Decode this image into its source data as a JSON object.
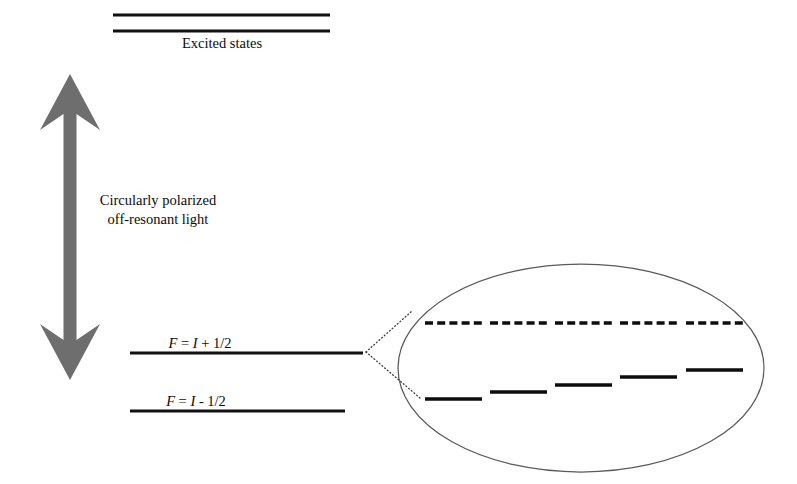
{
  "figure": {
    "type": "energy-level-diagram",
    "background_color": "#ffffff",
    "width": 797,
    "height": 484
  },
  "labels": {
    "excited_states": "Excited states",
    "beam_line1": "Circularly polarized",
    "beam_line2": "off-resonant light",
    "upper_hyperfine_F": "F",
    "upper_hyperfine_eq": " = ",
    "upper_hyperfine_I": "I",
    "upper_hyperfine_rest": " + 1/2",
    "lower_hyperfine_F": "F",
    "lower_hyperfine_eq": " = ",
    "lower_hyperfine_I": "I",
    "lower_hyperfine_rest": " - 1/2"
  },
  "colors": {
    "line_black": "#101010",
    "arrow_gray": "#6e6e6e",
    "ellipse_gray": "#5a5a5a",
    "leader_gray": "#3a3a3a",
    "text_black": "#0c0c0c"
  },
  "levels": {
    "excited": [
      {
        "name": "excited-level-upper",
        "x1": 113,
        "x2": 330,
        "y": 15
      },
      {
        "name": "excited-level-lower",
        "x1": 113,
        "x2": 330,
        "y": 31
      }
    ],
    "ground": [
      {
        "name": "ground-level-F-plus",
        "x1": 130,
        "x2": 363,
        "y": 353
      },
      {
        "name": "ground-level-F-minus",
        "x1": 130,
        "x2": 345,
        "y": 411
      }
    ]
  },
  "arrow": {
    "name": "circular-polarized-light-arrow",
    "color": "#6e6e6e",
    "shaft_x": 70,
    "shaft_half_width": 6.5,
    "top_tip_y": 74,
    "bottom_tip_y": 380,
    "head_half_width": 30,
    "head_length": 56,
    "barb_inset": 16,
    "direction": "double"
  },
  "inset": {
    "name": "zeeman-sublevel-inset",
    "ellipse": {
      "cx": 581,
      "cy": 368,
      "rx": 183,
      "ry": 104
    },
    "leader_vertex": {
      "x": 366,
      "y": 352
    },
    "leader_targets": [
      {
        "x": 412,
        "y": 311
      },
      {
        "x": 420,
        "y": 398
      }
    ],
    "unshifted_levels": {
      "y": 323,
      "segments": [
        {
          "x1": 425,
          "x2": 482
        },
        {
          "x1": 490,
          "x2": 547
        },
        {
          "x1": 555,
          "x2": 612
        },
        {
          "x1": 620,
          "x2": 677
        },
        {
          "x1": 686,
          "x2": 743
        }
      ]
    },
    "shifted_levels": [
      {
        "x1": 425,
        "x2": 482,
        "y": 399
      },
      {
        "x1": 490,
        "x2": 547,
        "y": 392
      },
      {
        "x1": 555,
        "x2": 612,
        "y": 385
      },
      {
        "x1": 620,
        "x2": 677,
        "y": 377
      },
      {
        "x1": 686,
        "x2": 743,
        "y": 370
      }
    ]
  },
  "text_positions": {
    "excited_states": {
      "x": 222,
      "y": 48
    },
    "beam_line1": {
      "x": 158,
      "y": 205
    },
    "beam_line2": {
      "x": 158,
      "y": 224
    },
    "upper_hyperfine": {
      "x": 200,
      "y": 348
    },
    "lower_hyperfine": {
      "x": 196,
      "y": 406
    }
  }
}
